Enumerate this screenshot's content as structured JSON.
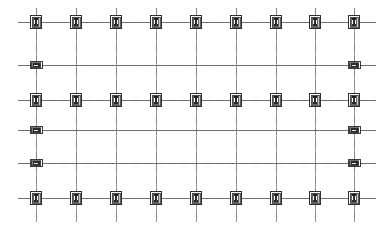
{
  "drawing": {
    "title": "Structural Column Grid Plan",
    "type": "cad-framing-plan",
    "canvas": {
      "width": 388,
      "height": 232,
      "background": "#ffffff"
    },
    "colors": {
      "gridline": "#8a8a8a",
      "gridline_major": "#555555",
      "centerline": "#7a7a7a",
      "column_outline": "#1a1a1a",
      "column_fill": "#c9c9c9",
      "column_core": "#2b2b2b",
      "beam_fill": "#7d7d7d",
      "paper": "#ffffff"
    },
    "grid": {
      "column_count": 9,
      "row_count": 6,
      "column_x": [
        36,
        76,
        116,
        156,
        196,
        236,
        276,
        315,
        354
      ],
      "row_y": [
        22,
        65,
        100,
        130,
        163,
        198
      ],
      "column_spacing": 39.8,
      "vertical_extent": {
        "top": 8,
        "bottom": 222
      },
      "horizontal_extent": {
        "left": 18,
        "right": 376
      }
    },
    "rows": [
      {
        "index": 1,
        "y": 22,
        "symbol": "column",
        "positions": "all"
      },
      {
        "index": 2,
        "y": 65,
        "symbol": "beam-splice",
        "positions": "ends"
      },
      {
        "index": 3,
        "y": 100,
        "symbol": "column",
        "positions": "all"
      },
      {
        "index": 4,
        "y": 130,
        "symbol": "beam-splice",
        "positions": "ends"
      },
      {
        "index": 5,
        "y": 163,
        "symbol": "beam-splice",
        "positions": "ends"
      },
      {
        "index": 6,
        "y": 198,
        "symbol": "column",
        "positions": "all"
      }
    ],
    "symbols": {
      "column": {
        "name": "column-section-symbol",
        "outer_width": 11,
        "outer_height": 13,
        "inner_width": 8,
        "inner_height": 10,
        "core_width": 4.5,
        "core_height": 8
      },
      "beam_splice": {
        "name": "beam-splice-symbol",
        "outer_width": 12,
        "outer_height": 7,
        "inner_width": 9.5,
        "inner_height": 5,
        "core_width": 7,
        "core_height": 3.4
      }
    },
    "counts": {
      "total_columns": 27,
      "total_beam_splices": 6,
      "total_gridlines_vertical": 9,
      "total_gridlines_horizontal": 6
    }
  }
}
